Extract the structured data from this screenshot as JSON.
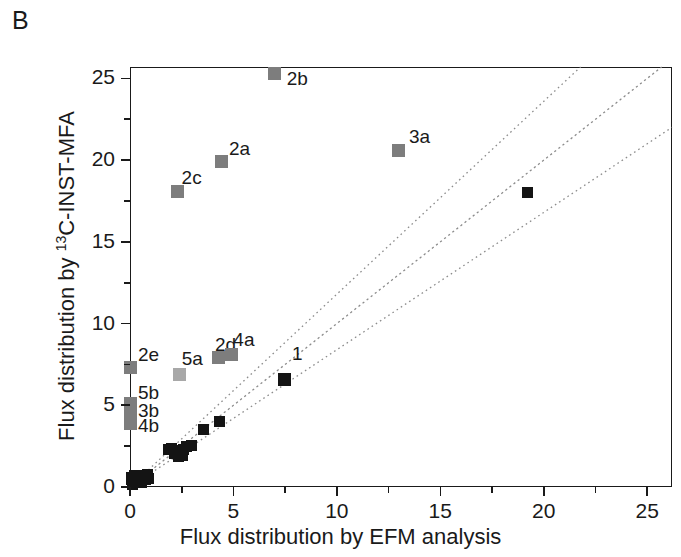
{
  "panel": {
    "label": "B"
  },
  "chart_data": {
    "type": "scatter",
    "title": "",
    "xlabel": "Flux distribution by EFM analysis",
    "ylabel": "Flux distribution by 13C-INST-MFA",
    "ylabel_prefix": "Flux distribution by ",
    "ylabel_sup": "13",
    "ylabel_suffix": "C-INST-MFA",
    "xlim": [
      0,
      26.2
    ],
    "ylim": [
      0,
      25.7
    ],
    "xticks": [
      0,
      5,
      10,
      15,
      20,
      25
    ],
    "yticks": [
      0,
      5,
      10,
      15,
      20,
      25
    ],
    "xtick_labels": [
      "0",
      "5",
      "10",
      "15",
      "20",
      "25"
    ],
    "ytick_labels": [
      "0",
      "5",
      "10",
      "15",
      "20",
      "25"
    ],
    "x_minor_step": 2.5,
    "y_minor_step": 2.5,
    "grid": false,
    "legend": "none",
    "colors": {
      "axis": "#1a1a1a",
      "marker_black": "#141414",
      "marker_gray": "#7d7d7d",
      "marker_lightgray": "#a8a8a8",
      "reference_line": "#8c8c8c"
    },
    "reference_lines": [
      {
        "name": "identity",
        "slope": 1.0,
        "intercept": 0.0,
        "style": "dotted"
      },
      {
        "name": "upper-band",
        "slope": 1.18,
        "intercept": 0.0,
        "style": "dotted"
      },
      {
        "name": "lower-band",
        "slope": 0.84,
        "intercept": 0.0,
        "style": "dotted"
      }
    ],
    "series": [
      {
        "name": "labelled-gray",
        "color": "#7d7d7d",
        "points": [
          {
            "label": "2b",
            "x": 7.0,
            "y": 25.3,
            "lx": 12,
            "ly": -6
          },
          {
            "label": "3a",
            "x": 13.0,
            "y": 20.6,
            "lx": 10,
            "ly": -24
          },
          {
            "label": "2a",
            "x": 4.4,
            "y": 19.9,
            "lx": 8,
            "ly": -24
          },
          {
            "label": "2c",
            "x": 2.3,
            "y": 18.1,
            "lx": 4,
            "ly": -24
          },
          {
            "label": "2d",
            "x": 4.3,
            "y": 7.9,
            "lx": -4,
            "ly": -24
          },
          {
            "label": "4a",
            "x": 4.9,
            "y": 8.1,
            "lx": 2,
            "ly": -26
          },
          {
            "label": "2e",
            "x": 0.0,
            "y": 7.3,
            "lx": 8,
            "ly": -24
          },
          {
            "label": "5b",
            "x": 0.0,
            "y": 5.1,
            "lx": 8,
            "ly": -22
          },
          {
            "label": "3b",
            "x": 0.0,
            "y": 4.7,
            "lx": 8,
            "ly": -10
          },
          {
            "label": "4b",
            "x": 0.0,
            "y": 3.9,
            "lx": 8,
            "ly": -8
          }
        ]
      },
      {
        "name": "labelled-lightgray",
        "color": "#a8a8a8",
        "points": [
          {
            "label": "5a",
            "x": 2.4,
            "y": 6.9,
            "lx": 2,
            "ly": -26
          }
        ]
      },
      {
        "name": "labelled-black",
        "color": "#141414",
        "points": [
          {
            "label": "1",
            "x": 7.45,
            "y": 6.6,
            "lx": 8,
            "ly": -36
          }
        ]
      },
      {
        "name": "unlabelled-black",
        "color": "#141414",
        "points": [
          {
            "x": 19.2,
            "y": 18.0
          },
          {
            "x": 4.35,
            "y": 4.0
          },
          {
            "x": 3.55,
            "y": 3.5
          },
          {
            "x": 2.95,
            "y": 2.55
          },
          {
            "x": 2.75,
            "y": 2.45
          },
          {
            "x": 2.6,
            "y": 2.3
          },
          {
            "x": 2.45,
            "y": 2.25
          },
          {
            "x": 2.3,
            "y": 2.15
          },
          {
            "x": 2.15,
            "y": 2.05
          },
          {
            "x": 2.0,
            "y": 2.35
          },
          {
            "x": 1.85,
            "y": 2.3
          },
          {
            "x": 2.55,
            "y": 1.95
          },
          {
            "x": 2.35,
            "y": 1.85
          },
          {
            "x": 0.85,
            "y": 0.75
          },
          {
            "x": 0.7,
            "y": 0.65
          },
          {
            "x": 0.6,
            "y": 0.6
          },
          {
            "x": 0.5,
            "y": 0.55
          },
          {
            "x": 0.4,
            "y": 0.5
          },
          {
            "x": 0.35,
            "y": 0.45
          },
          {
            "x": 0.3,
            "y": 0.4
          },
          {
            "x": 0.25,
            "y": 0.35
          },
          {
            "x": 0.2,
            "y": 0.3
          },
          {
            "x": 0.15,
            "y": 0.25
          },
          {
            "x": 0.12,
            "y": 0.2
          },
          {
            "x": 0.1,
            "y": 0.15
          },
          {
            "x": 0.08,
            "y": 0.45
          },
          {
            "x": 0.05,
            "y": 0.6
          },
          {
            "x": 0.55,
            "y": 0.3
          },
          {
            "x": 0.75,
            "y": 0.45
          },
          {
            "x": 0.9,
            "y": 0.5
          },
          {
            "x": 0.45,
            "y": 0.7
          },
          {
            "x": 0.22,
            "y": 0.72
          }
        ]
      }
    ]
  }
}
